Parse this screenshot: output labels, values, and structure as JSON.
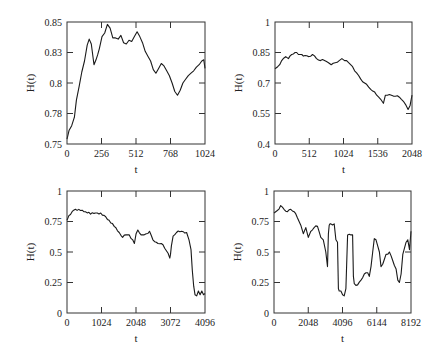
{
  "figure": {
    "background": "#ffffff",
    "line_color": "#1a1a1a"
  },
  "chart_data": [
    {
      "type": "line",
      "title": "",
      "xlabel": "t",
      "ylabel": "H(t)",
      "xlim": [
        0,
        1024
      ],
      "ylim": [
        0.75,
        0.85
      ],
      "xticks": [
        0,
        256,
        512,
        768,
        1024
      ],
      "xtick_labels": [
        "0",
        "256",
        "512",
        "768",
        "1024"
      ],
      "yticks": [
        0.75,
        0.775,
        0.8,
        0.825,
        0.85
      ],
      "ytick_labels": [
        "0.75",
        "0.78",
        "0.8",
        "0.83",
        "0.85"
      ],
      "grid": false,
      "frame_px": {
        "left": 67,
        "top": 22,
        "right": 205,
        "bottom": 144
      },
      "series": [
        {
          "name": "H(t)",
          "x": [
            0,
            15,
            35,
            55,
            70,
            90,
            110,
            130,
            150,
            165,
            180,
            200,
            215,
            240,
            260,
            280,
            300,
            320,
            340,
            360,
            380,
            400,
            420,
            440,
            460,
            480,
            500,
            520,
            540,
            560,
            580,
            600,
            620,
            640,
            660,
            680,
            700,
            720,
            740,
            760,
            780,
            800,
            820,
            840,
            860,
            880,
            900,
            920,
            940,
            960,
            980,
            1000,
            1015,
            1024
          ],
          "values": [
            0.754,
            0.761,
            0.765,
            0.772,
            0.786,
            0.797,
            0.809,
            0.818,
            0.831,
            0.836,
            0.832,
            0.815,
            0.819,
            0.828,
            0.838,
            0.841,
            0.848,
            0.845,
            0.837,
            0.837,
            0.836,
            0.839,
            0.833,
            0.832,
            0.835,
            0.834,
            0.838,
            0.842,
            0.838,
            0.833,
            0.826,
            0.822,
            0.818,
            0.811,
            0.808,
            0.812,
            0.816,
            0.814,
            0.81,
            0.806,
            0.8,
            0.793,
            0.79,
            0.794,
            0.8,
            0.803,
            0.806,
            0.808,
            0.81,
            0.813,
            0.815,
            0.818,
            0.819,
            0.812
          ]
        }
      ]
    },
    {
      "type": "line",
      "title": "",
      "xlabel": "t",
      "ylabel": "H(t)",
      "xlim": [
        0,
        2048
      ],
      "ylim": [
        0.4,
        1.0
      ],
      "xticks": [
        0,
        512,
        1024,
        1536,
        2048
      ],
      "xtick_labels": [
        "0",
        "512",
        "1024",
        "1536",
        "2048"
      ],
      "yticks": [
        0.4,
        0.55,
        0.7,
        0.85,
        1.0
      ],
      "ytick_labels": [
        "0.4",
        "0.55",
        "0.7",
        "0.85",
        "1"
      ],
      "grid": false,
      "frame_px": {
        "left": 275,
        "top": 22,
        "right": 412,
        "bottom": 144
      },
      "series": [
        {
          "name": "H(t)",
          "x": [
            0,
            40,
            100,
            160,
            200,
            250,
            300,
            350,
            400,
            450,
            500,
            560,
            620,
            680,
            740,
            800,
            840,
            900,
            960,
            1000,
            1040,
            1100,
            1160,
            1220,
            1280,
            1340,
            1400,
            1460,
            1520,
            1580,
            1620,
            1650,
            1680,
            1740,
            1800,
            1860,
            1920,
            1960,
            1990,
            2020,
            2048
          ],
          "values": [
            0.77,
            0.78,
            0.81,
            0.83,
            0.82,
            0.84,
            0.85,
            0.84,
            0.84,
            0.835,
            0.83,
            0.84,
            0.82,
            0.81,
            0.81,
            0.8,
            0.79,
            0.8,
            0.81,
            0.82,
            0.81,
            0.8,
            0.78,
            0.75,
            0.72,
            0.7,
            0.68,
            0.66,
            0.64,
            0.62,
            0.6,
            0.64,
            0.64,
            0.64,
            0.635,
            0.63,
            0.61,
            0.59,
            0.57,
            0.59,
            0.64
          ]
        }
      ]
    },
    {
      "type": "line",
      "title": "",
      "xlabel": "t",
      "ylabel": "H(t)",
      "xlim": [
        0,
        4096
      ],
      "ylim": [
        0,
        1
      ],
      "xticks": [
        0,
        1024,
        2048,
        3072,
        4096
      ],
      "xtick_labels": [
        "0",
        "1024",
        "2048",
        "3072",
        "4096"
      ],
      "yticks": [
        0,
        0.25,
        0.5,
        0.75,
        1
      ],
      "ytick_labels": [
        "0",
        "0.25",
        "0.5",
        "0.75",
        "1"
      ],
      "grid": false,
      "frame_px": {
        "left": 67,
        "top": 191,
        "right": 205,
        "bottom": 313
      },
      "series": [
        {
          "name": "H(t)",
          "x": [
            0,
            60,
            150,
            250,
            400,
            550,
            700,
            850,
            1000,
            1100,
            1250,
            1400,
            1550,
            1650,
            1750,
            1850,
            1950,
            2000,
            2050,
            2100,
            2200,
            2280,
            2350,
            2450,
            2550,
            2650,
            2700,
            2800,
            2900,
            3000,
            3050,
            3072,
            3100,
            3150,
            3250,
            3400,
            3550,
            3620,
            3680,
            3720,
            3760,
            3800,
            3850,
            3900,
            3950,
            4000,
            4050,
            4096
          ],
          "values": [
            0.76,
            0.8,
            0.83,
            0.85,
            0.84,
            0.83,
            0.81,
            0.82,
            0.82,
            0.8,
            0.76,
            0.71,
            0.66,
            0.62,
            0.64,
            0.64,
            0.6,
            0.57,
            0.65,
            0.68,
            0.64,
            0.64,
            0.65,
            0.67,
            0.6,
            0.58,
            0.57,
            0.57,
            0.53,
            0.49,
            0.45,
            0.48,
            0.55,
            0.63,
            0.66,
            0.67,
            0.66,
            0.6,
            0.52,
            0.35,
            0.22,
            0.15,
            0.14,
            0.18,
            0.15,
            0.18,
            0.15,
            0.16
          ]
        }
      ]
    },
    {
      "type": "line",
      "title": "",
      "xlabel": "t",
      "ylabel": "H(t)",
      "xlim": [
        0,
        8192
      ],
      "ylim": [
        0,
        1
      ],
      "xticks": [
        0,
        2048,
        4096,
        6144,
        8192
      ],
      "xtick_labels": [
        "0",
        "2048",
        "4096",
        "6144",
        "8192"
      ],
      "yticks": [
        0,
        0.25,
        0.5,
        0.75,
        1
      ],
      "ytick_labels": [
        "0",
        "0.25",
        "0.5",
        "0.75",
        "1"
      ],
      "grid": false,
      "frame_px": {
        "left": 274,
        "top": 191,
        "right": 411,
        "bottom": 313
      },
      "series": [
        {
          "name": "H(t)",
          "x": [
            0,
            200,
            400,
            600,
            800,
            1000,
            1200,
            1400,
            1600,
            1750,
            1900,
            2050,
            2200,
            2400,
            2600,
            2800,
            2950,
            3100,
            3200,
            3250,
            3300,
            3350,
            3400,
            3600,
            3700,
            3800,
            3850,
            3900,
            4000,
            4100,
            4200,
            4300,
            4400,
            4600,
            4700,
            4750,
            4800,
            5000,
            5200,
            5400,
            5600,
            5700,
            5800,
            5900,
            6000,
            6100,
            6200,
            6300,
            6400,
            6500,
            6700,
            6900,
            7100,
            7300,
            7400,
            7500,
            7600,
            7700,
            7800,
            7900,
            8000,
            8100,
            8192
          ],
          "values": [
            0.82,
            0.84,
            0.88,
            0.85,
            0.83,
            0.85,
            0.83,
            0.78,
            0.72,
            0.65,
            0.7,
            0.62,
            0.67,
            0.7,
            0.71,
            0.62,
            0.6,
            0.5,
            0.38,
            0.65,
            0.72,
            0.73,
            0.73,
            0.73,
            0.6,
            0.58,
            0.2,
            0.18,
            0.18,
            0.15,
            0.14,
            0.2,
            0.64,
            0.64,
            0.64,
            0.3,
            0.24,
            0.23,
            0.27,
            0.32,
            0.33,
            0.3,
            0.38,
            0.5,
            0.61,
            0.6,
            0.55,
            0.5,
            0.38,
            0.4,
            0.48,
            0.5,
            0.43,
            0.36,
            0.27,
            0.25,
            0.32,
            0.48,
            0.53,
            0.58,
            0.6,
            0.52,
            0.67
          ]
        }
      ]
    }
  ]
}
